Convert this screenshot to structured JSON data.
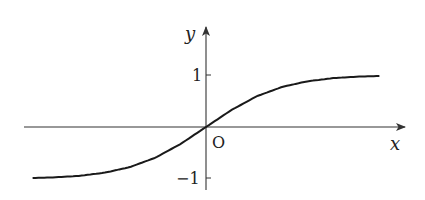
{
  "chart_data": {
    "type": "line",
    "title": "",
    "xlabel": "x",
    "ylabel": "y",
    "origin_label": "O",
    "y_ticks": [
      {
        "value": 1,
        "label": "1"
      },
      {
        "value": -1,
        "label": "−1"
      }
    ],
    "x_ticks": [],
    "grid": false,
    "legend": null,
    "asymptotes": [
      1,
      -1
    ],
    "function_shape": "sigmoid / tanh-like, odd function through origin, approaching y=1 as x→+∞ and y=−1 as x→−∞",
    "series": [
      {
        "name": "curve",
        "points": [
          {
            "x": -3.4,
            "y": -0.99
          },
          {
            "x": -3.0,
            "y": -0.98
          },
          {
            "x": -2.5,
            "y": -0.95
          },
          {
            "x": -2.0,
            "y": -0.89
          },
          {
            "x": -1.5,
            "y": -0.78
          },
          {
            "x": -1.0,
            "y": -0.6
          },
          {
            "x": -0.5,
            "y": -0.33
          },
          {
            "x": 0.0,
            "y": 0.0
          },
          {
            "x": 0.5,
            "y": 0.33
          },
          {
            "x": 1.0,
            "y": 0.6
          },
          {
            "x": 1.5,
            "y": 0.78
          },
          {
            "x": 2.0,
            "y": 0.89
          },
          {
            "x": 2.5,
            "y": 0.95
          },
          {
            "x": 3.0,
            "y": 0.98
          },
          {
            "x": 3.4,
            "y": 0.99
          }
        ]
      }
    ],
    "xlim": [
      -3.6,
      3.9
    ],
    "ylim": [
      -1.2,
      2.0
    ]
  },
  "colors": {
    "axis": "#333333",
    "curve": "#1a1a1a",
    "background": "#ffffff"
  }
}
